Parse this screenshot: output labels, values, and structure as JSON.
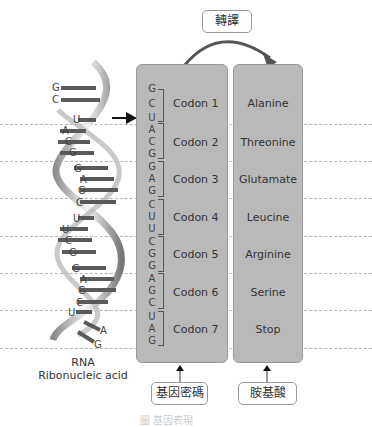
{
  "title_box": {
    "label": "轉譯"
  },
  "rna": {
    "line1": "RNA",
    "line2": "Ribonucleic acid",
    "helix_letters": [
      "G",
      "C",
      "U",
      "A",
      "C",
      "G",
      "G",
      "A",
      "G",
      "C",
      "U",
      "U",
      "C",
      "G",
      "G",
      "A",
      "G",
      "C",
      "U",
      "A",
      "G"
    ]
  },
  "codons": [
    {
      "label": "Codon 1",
      "bases": [
        "G",
        "C",
        "U"
      ],
      "amino": "Alanine"
    },
    {
      "label": "Codon 2",
      "bases": [
        "A",
        "C",
        "G"
      ],
      "amino": "Threonine"
    },
    {
      "label": "Codon 3",
      "bases": [
        "G",
        "A",
        "G"
      ],
      "amino": "Glutamate"
    },
    {
      "label": "Codon 4",
      "bases": [
        "C",
        "U",
        "U"
      ],
      "amino": "Leucine"
    },
    {
      "label": "Codon 5",
      "bases": [
        "C",
        "G",
        "G"
      ],
      "amino": "Arginine"
    },
    {
      "label": "Codon 6",
      "bases": [
        "A",
        "G",
        "C"
      ],
      "amino": "Serine"
    },
    {
      "label": "Codon 7",
      "bases": [
        "U",
        "A",
        "G"
      ],
      "amino": "Stop"
    }
  ],
  "bottom_labels": {
    "codon": "基因密碼",
    "amino": "胺基酸"
  },
  "caption_faded": "圖 基因表現",
  "colors": {
    "panel": "#b9b9b9",
    "arrow": "#555555",
    "dash": "#b5b5b5"
  }
}
